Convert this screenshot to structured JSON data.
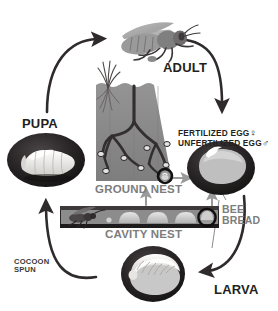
{
  "diagram": {
    "type": "cycle-diagram",
    "background": "#ffffff"
  },
  "stages": {
    "adult": {
      "label": "ADULT",
      "icon": "adult-bee-icon"
    },
    "pupa": {
      "label": "PUPA",
      "icon": "pupa-icon"
    },
    "larva": {
      "label": "LARVA",
      "icon": "larva-icon"
    },
    "egg": {
      "icon": "egg-cell-icon"
    }
  },
  "nests": {
    "ground": {
      "label": "GROUND NEST",
      "icon": "ground-nest-icon"
    },
    "cavity": {
      "label": "CAVITY NEST",
      "icon": "cavity-nest-icon"
    }
  },
  "annotations": {
    "fertilized_egg": "FERTILIZED EGG",
    "fertilized_symbol": "♀",
    "unfertilized_egg": "UNFERTILIZED EGG",
    "unfertilized_symbol": "♂",
    "bee_bread": "BEE\nBREAD",
    "cocoon_spun": "COCOON\nSPUN"
  },
  "colors": {
    "text_dark": "#231f20",
    "text_grey": "#7d7d7d",
    "arrow_dark": "#2f2b2c",
    "arrow_grey": "#9a9a9a",
    "soil": "#8a8a8a",
    "tunnel": "#3a3637",
    "cell_dark": "#262223",
    "cell_light": "#d9d9d9",
    "provision": "#c9c9c9",
    "larva_body": "#f2f0ec",
    "bee_body": "#8e8e8e"
  }
}
